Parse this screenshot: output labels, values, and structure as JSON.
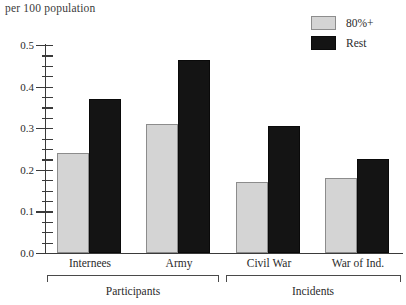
{
  "chart_data": {
    "type": "bar",
    "title": "per 100 population",
    "xlabel": "",
    "ylabel": "per 100 population",
    "ylim": [
      0.0,
      0.5
    ],
    "ytick_labels": [
      "0.0",
      "0.1",
      "0.2",
      "0.3",
      "0.4",
      "0.5"
    ],
    "ytick_values": [
      0.0,
      0.1,
      0.2,
      0.3,
      0.4,
      0.5
    ],
    "minor_tick_step": 0.025,
    "grid": false,
    "legend_position": "top-right",
    "categories": [
      "Internees",
      "Army",
      "Civil War",
      "War of Ind."
    ],
    "groups": [
      {
        "label": "Participants",
        "categories": [
          "Internees",
          "Army"
        ]
      },
      {
        "label": "Incidents",
        "categories": [
          "Civil War",
          "War of Ind."
        ]
      }
    ],
    "series": [
      {
        "name": "80%+",
        "color": "#d4d4d4",
        "values": [
          0.24,
          0.31,
          0.17,
          0.18
        ]
      },
      {
        "name": "Rest",
        "color": "#141414",
        "values": [
          0.37,
          0.465,
          0.305,
          0.225
        ]
      }
    ]
  },
  "legend": {
    "items": [
      {
        "label": "80%+",
        "swatch": "light-gray-swatch"
      },
      {
        "label": "Rest",
        "swatch": "black-swatch"
      }
    ]
  },
  "axis": {
    "title": "per 100 population",
    "ticks": [
      "0.5",
      "0.4",
      "0.3",
      "0.2",
      "0.1",
      "0.0"
    ]
  },
  "categories": [
    {
      "label": "Internees"
    },
    {
      "label": "Army"
    },
    {
      "label": "Civil War"
    },
    {
      "label": "War of Ind."
    }
  ],
  "groups": [
    {
      "label": "Participants"
    },
    {
      "label": "Incidents"
    }
  ]
}
